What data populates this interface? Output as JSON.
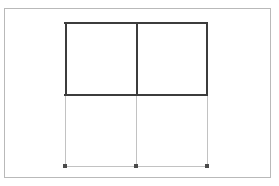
{
  "canvas": {
    "width": 279,
    "height": 186,
    "background_color": "#ffffff"
  },
  "page_frame": {
    "label": "page-border",
    "x": 4,
    "y": 8,
    "width": 267,
    "height": 170,
    "stroke_color": "#b9b9b9",
    "stroke_width": 1,
    "fill_color": "#ffffff"
  },
  "colors": {
    "active_stroke": "#3c3c3c",
    "ghost_stroke": "#c2c2c2",
    "handle_fill": "#4a4a4a",
    "frame_stroke": "#b9b9b9",
    "background": "#ffffff"
  },
  "grid": {
    "left": 65,
    "right": 207,
    "middle": 136,
    "top": 22,
    "divider": 95,
    "bottom": 166,
    "columns": 2,
    "rows": 2
  },
  "upper_block": {
    "label": "active-row",
    "state": "selected",
    "stroke_color": "#3c3c3c",
    "stroke_width": 2,
    "cells": [
      {
        "label": "upper-left-cell",
        "x": 65,
        "y": 22,
        "width": 71,
        "height": 73
      },
      {
        "label": "upper-right-cell",
        "x": 136,
        "y": 22,
        "width": 71,
        "height": 73
      }
    ]
  },
  "lower_block": {
    "label": "ghost-row",
    "state": "inactive",
    "stroke_color": "#c2c2c2",
    "stroke_width": 1,
    "cells": [
      {
        "label": "lower-left-cell",
        "x": 65,
        "y": 95,
        "width": 71,
        "height": 71
      },
      {
        "label": "lower-right-cell",
        "x": 136,
        "y": 95,
        "width": 71,
        "height": 71
      }
    ]
  },
  "handles": [
    {
      "label": "handle-bottom-left",
      "x": 65,
      "y": 166
    },
    {
      "label": "handle-bottom-center",
      "x": 136,
      "y": 166
    },
    {
      "label": "handle-bottom-right",
      "x": 207,
      "y": 166
    }
  ]
}
